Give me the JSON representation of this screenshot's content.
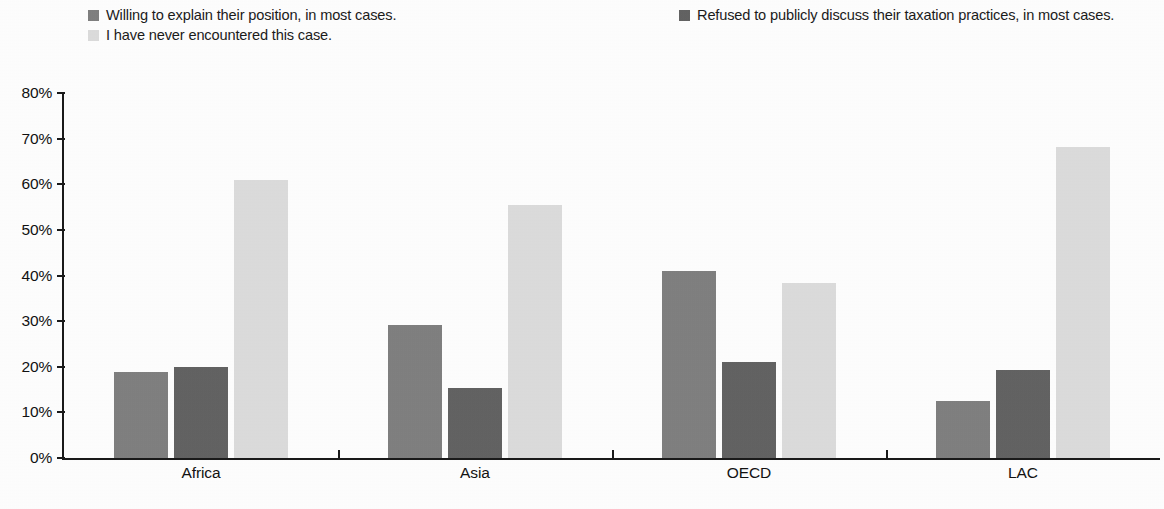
{
  "chart_data": {
    "type": "bar",
    "title": "",
    "subtitle": "",
    "xlabel": "",
    "ylabel": "",
    "ylim": [
      0,
      80
    ],
    "yticks": [
      "0%",
      "10%",
      "20%",
      "30%",
      "40%",
      "50%",
      "60%",
      "70%",
      "80%"
    ],
    "ytick_values": [
      0,
      10,
      20,
      30,
      40,
      50,
      60,
      70,
      80
    ],
    "grid": false,
    "legend_position": "top",
    "value_unit": "%",
    "categories": [
      "Africa",
      "Asia",
      "OECD",
      "LAC"
    ],
    "series": [
      {
        "name": "Willing to explain their position, in most cases.",
        "color": "#808080",
        "values": [
          18.8,
          29.2,
          41.0,
          12.6
        ]
      },
      {
        "name": "Refused to publicly discuss their taxation practices, in most cases.",
        "color": "#636363",
        "values": [
          20.0,
          15.4,
          21.0,
          19.4
        ]
      },
      {
        "name": "I have never encountered this case.",
        "color": "#dcdcdc",
        "values": [
          61.0,
          55.4,
          38.4,
          68.1
        ]
      }
    ]
  },
  "legend": {
    "entries": [
      {
        "label": "Willing to explain their position, in most cases.",
        "color": "#808080"
      },
      {
        "label": "I have never encountered this case.",
        "color": "#dcdcdc"
      },
      {
        "label": "Refused to publicly discuss their taxation practices, in most cases.",
        "color": "#636363"
      }
    ]
  },
  "axis": {
    "y_labels": [
      "80%",
      "70%",
      "60%",
      "50%",
      "40%",
      "30%",
      "20%",
      "10%",
      "0%"
    ],
    "x_labels": [
      "Africa",
      "Asia",
      "OECD",
      "LAC"
    ]
  }
}
